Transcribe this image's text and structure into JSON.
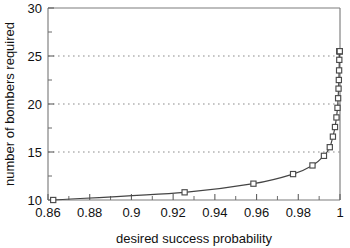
{
  "chart_data": {
    "type": "line",
    "title": "",
    "subtitle": "",
    "xlabel": "desired success probability",
    "ylabel": "number of bombers required",
    "xlim": [
      0.86,
      1.0
    ],
    "ylim": [
      10,
      30
    ],
    "grid": true,
    "grid_axis": "y",
    "gridlines_y": [
      15,
      20,
      25
    ],
    "legend": "none",
    "marker": "open-square",
    "line_style": "solid",
    "xticks": [
      0.86,
      0.88,
      0.9,
      0.92,
      0.94,
      0.96,
      0.98,
      1
    ],
    "xtick_labels": [
      "0.86",
      "0.88",
      "0.9",
      "0.92",
      "0.94",
      "0.96",
      "0.98",
      "1"
    ],
    "xticks_minor": [
      0.87,
      0.89,
      0.91,
      0.93,
      0.95,
      0.97,
      0.99
    ],
    "yticks": [
      10,
      15,
      20,
      25,
      30
    ],
    "ytick_labels": [
      "10",
      "15",
      "20",
      "25",
      "30"
    ],
    "yticks_minor": [
      12.5,
      17.5,
      22.5,
      27.5
    ],
    "series": [
      {
        "name": "bombers required",
        "x": [
          0.8625,
          0.9255,
          0.9585,
          0.9775,
          0.9868,
          0.9923,
          0.9951,
          0.9966,
          0.9976,
          0.9983,
          0.9988,
          0.9991,
          0.9993,
          0.99945,
          0.99957,
          0.99966,
          0.99974,
          0.9998,
          0.99985,
          0.99989
        ],
        "values": [
          10.0,
          10.8,
          11.7,
          12.7,
          13.6,
          14.6,
          15.5,
          16.6,
          17.6,
          18.6,
          19.6,
          20.6,
          21.6,
          22.5,
          23.5,
          24.6,
          25.5,
          25.5,
          25.5,
          25.5
        ]
      }
    ],
    "annotations": []
  },
  "figure": {
    "xlabel": "desired success probability",
    "ylabel": "number of bombers required",
    "background_color": "#ffffff",
    "line_color": "#444444",
    "marker_fill": "#ffffff",
    "marker_edge": "#4a4a4a",
    "grid_color": "#8d8d8d",
    "axis_color": "#7d7d7d"
  }
}
